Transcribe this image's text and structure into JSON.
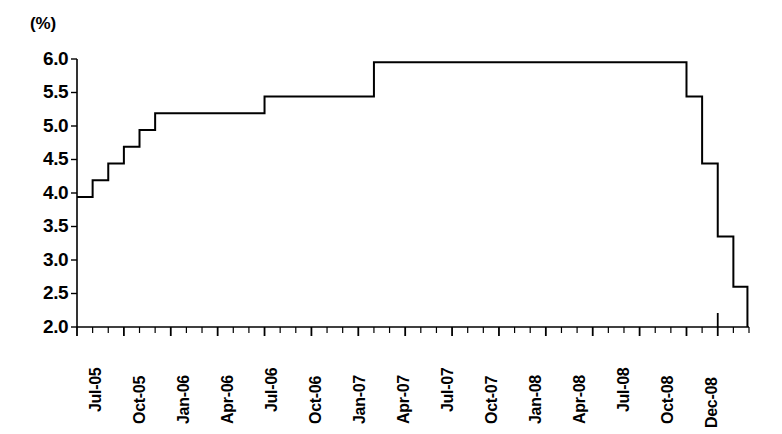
{
  "chart_data": {
    "type": "line",
    "style": "step-post",
    "title": "",
    "subtitle": "",
    "xlabel": "",
    "ylabel": "(%)",
    "unit_label": "(%)",
    "ylim": [
      2.0,
      6.0
    ],
    "ytick_labels": [
      "6.0",
      "5.5",
      "5.0",
      "4.5",
      "4.0",
      "3.5",
      "3.0",
      "2.5",
      "2.0"
    ],
    "ytick_values": [
      6.0,
      5.5,
      5.0,
      4.5,
      4.0,
      3.5,
      3.0,
      2.5,
      2.0
    ],
    "xtick_labels": [
      "Jul-05",
      "Oct-05",
      "Jan-06",
      "Apr-06",
      "Jul-06",
      "Oct-06",
      "Jan-07",
      "Apr-07",
      "Jul-07",
      "Oct-07",
      "Jan-08",
      "Apr-08",
      "Jul-08",
      "Oct-08",
      "Dec-08"
    ],
    "xlim": [
      "Jul-05",
      "Feb-09"
    ],
    "grid": false,
    "legend": null,
    "minor_ticks": "monthly",
    "line_color": "#000000",
    "line_width": 2,
    "series": [
      {
        "name": "Policy rate",
        "x": [
          "Jul-05",
          "Aug-05",
          "Sep-05",
          "Oct-05",
          "Nov-05",
          "Dec-05",
          "Jan-06",
          "Feb-06",
          "Mar-06",
          "Apr-06",
          "May-06",
          "Jun-06",
          "Jul-06",
          "Aug-06",
          "Sep-06",
          "Oct-06",
          "Nov-06",
          "Dec-06",
          "Jan-07",
          "Feb-07",
          "Mar-07",
          "Apr-07",
          "May-07",
          "Jun-07",
          "Jul-07",
          "Aug-07",
          "Sep-07",
          "Oct-07",
          "Nov-07",
          "Dec-07",
          "Jan-08",
          "Feb-08",
          "Mar-08",
          "Apr-08",
          "May-08",
          "Jun-08",
          "Jul-08",
          "Aug-08",
          "Sep-08",
          "Oct-08",
          "Nov-08",
          "Dec-08",
          "Jan-09"
        ],
        "values": [
          3.94,
          4.19,
          4.44,
          4.69,
          4.94,
          5.19,
          5.19,
          5.19,
          5.19,
          5.19,
          5.19,
          5.19,
          5.44,
          5.44,
          5.44,
          5.44,
          5.44,
          5.44,
          5.44,
          5.95,
          5.95,
          5.95,
          5.95,
          5.95,
          5.95,
          5.95,
          5.95,
          5.95,
          5.95,
          5.95,
          5.95,
          5.95,
          5.95,
          5.95,
          5.95,
          5.95,
          5.95,
          5.95,
          5.95,
          5.44,
          4.44,
          3.35,
          2.6
        ]
      }
    ]
  },
  "axes": {
    "y_axis_name": "percent-axis",
    "x_axis_name": "month-axis"
  }
}
